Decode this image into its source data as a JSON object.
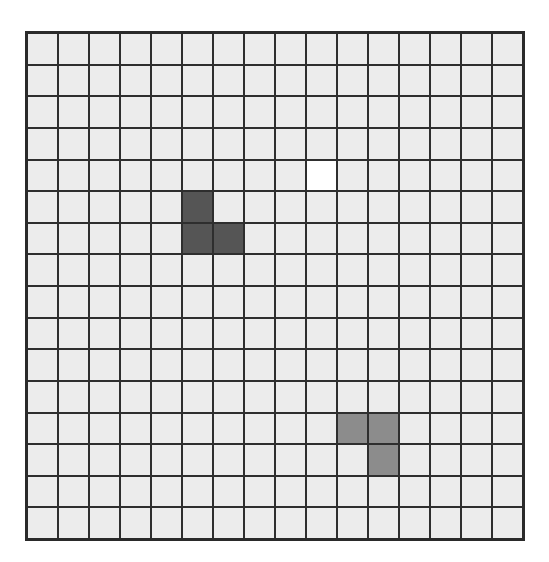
{
  "caption": {
    "text": "",
    "note": "Top line of text cut off by image edge; only descenders visible"
  },
  "grid": {
    "rows": 16,
    "cols": 16,
    "colors": {
      "empty": "#ececec",
      "line": "#2e2e2e",
      "target": "#ffffff",
      "dark_piece": "#555555",
      "gray_piece": "#8c8c8c"
    },
    "special_cells": [
      {
        "row": 4,
        "col": 9,
        "type": "white"
      },
      {
        "row": 5,
        "col": 5,
        "type": "dark"
      },
      {
        "row": 6,
        "col": 5,
        "type": "dark"
      },
      {
        "row": 6,
        "col": 6,
        "type": "dark"
      },
      {
        "row": 12,
        "col": 10,
        "type": "gray"
      },
      {
        "row": 12,
        "col": 11,
        "type": "gray"
      },
      {
        "row": 13,
        "col": 11,
        "type": "gray"
      }
    ],
    "pieces": [
      {
        "name": "dark-l-tromino",
        "color": "#555555",
        "cells": [
          [
            5,
            5
          ],
          [
            6,
            5
          ],
          [
            6,
            6
          ]
        ]
      },
      {
        "name": "gray-l-tromino",
        "color": "#8c8c8c",
        "cells": [
          [
            12,
            10
          ],
          [
            12,
            11
          ],
          [
            13,
            11
          ]
        ]
      }
    ],
    "target_cell": {
      "row": 4,
      "col": 9
    }
  }
}
